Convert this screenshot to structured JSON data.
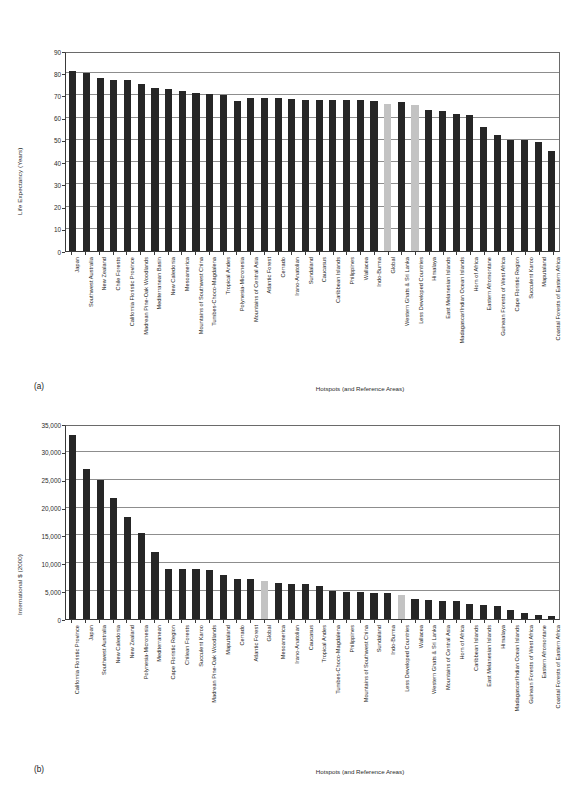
{
  "figure": {
    "panels": [
      {
        "tag": "(a)",
        "ylabel": "Life Expectancy (Years)",
        "xlabel": "Hotspots (and Reference Areas)"
      },
      {
        "tag": "(b)",
        "ylabel": "International $ (2000)",
        "xlabel": "Hotspots (and Reference Areas)"
      }
    ],
    "colors": {
      "bar": "#262626",
      "highlight": "#c3c3c3",
      "grid": "#8d8d8d",
      "axis": "#3a3a3a"
    }
  },
  "chart_data": [
    {
      "type": "bar",
      "title": "",
      "panel": "(a)",
      "xlabel": "Hotspots (and Reference Areas)",
      "ylabel": "Life Expectancy (Years)",
      "ylim": [
        0,
        90
      ],
      "yticks": [
        0,
        10,
        20,
        30,
        40,
        50,
        60,
        70,
        80,
        90
      ],
      "ytick_labels": [
        "0",
        "10",
        "20",
        "30",
        "40",
        "50",
        "60",
        "70",
        "80",
        "90"
      ],
      "grid": true,
      "legend": "none",
      "highlight_categories": [
        "Global",
        "Less Developed Countries"
      ],
      "categories": [
        "Japan",
        "Southwest Australia",
        "New Zealand",
        "Chile Forests",
        "California Floristic Province",
        "Madrean Pine-Oak Woodlands",
        "Mediterranean Basin",
        "New Caledonia",
        "Mesoamerica",
        "Mountains of Southwest China",
        "Tumbes-Choco-Magdalena",
        "Tropical Andes",
        "Polynesia-Micronesia",
        "Mountains of Central Asia",
        "Atlantic Forest",
        "Cerrado",
        "Irano-Anatolian",
        "Sundaland",
        "Caucasus",
        "Caribbean Islands",
        "Philippines",
        "Wallacea",
        "Indo-Burma",
        "Global",
        "Western Ghats & Sri Lanka",
        "Less Developed Countries",
        "Himalaya",
        "East Melanesian Islands",
        "Madagascar/Indian Ocean Islands",
        "Horn of Africa",
        "Eastern Afromontane",
        "Guinean Forests of West Africa",
        "Cape Floristic Region",
        "Succulent Karoo",
        "Maputaland",
        "Coastal Forests of Eastern Africa"
      ],
      "values": [
        81.0,
        80.0,
        78.0,
        77.0,
        77.0,
        75.0,
        73.5,
        73.0,
        72.0,
        71.0,
        70.8,
        70.0,
        67.5,
        69.0,
        69.0,
        69.0,
        68.3,
        68.0,
        68.0,
        68.0,
        68.0,
        68.0,
        67.5,
        66.0,
        67.0,
        65.5,
        63.5,
        63.0,
        61.5,
        61.0,
        56.0,
        52.0,
        50.0,
        50.0,
        49.0,
        45.0
      ]
    },
    {
      "type": "bar",
      "title": "",
      "panel": "(b)",
      "xlabel": "Hotspots (and Reference Areas)",
      "ylabel": "International $ (2000)",
      "ylim": [
        0,
        35000
      ],
      "yticks": [
        0,
        5000,
        10000,
        15000,
        20000,
        25000,
        30000,
        35000
      ],
      "ytick_labels": [
        "0",
        "5,000",
        "10,000",
        "15,000",
        "20,000",
        "25,000",
        "30,000",
        "35,000"
      ],
      "grid": true,
      "legend": "none",
      "highlight_categories": [
        "Global",
        "Less Developed Countries"
      ],
      "categories": [
        "California Floristic Province",
        "Japan",
        "Southwest Australia",
        "New Caledonia",
        "New Zealand",
        "Polynesia-Micronesia",
        "Mediterranean",
        "Cape Floristic Region",
        "Chilean Forests",
        "Succulent Karoo",
        "Madrean Pine-Oak Woodlands",
        "Maputaland",
        "Cerrado",
        "Atlantic Forest",
        "Global",
        "Mesoamerica",
        "Irano-Anatolian",
        "Caucasus",
        "Tropical Andes",
        "Tumbes-Choco-Magdalena",
        "Philippines",
        "Mountains of Southwest China",
        "Sundaland",
        "Indo-Burma",
        "Less Developed Countries",
        "Wallacea",
        "Western Ghats & Sri Lanka",
        "Mountains of Central Asia",
        "Horn of Africa",
        "Caribbean Islands",
        "East Melanesian Islands",
        "Himalaya",
        "Madagascar/Indian Ocean Islands",
        "Guinean Forests of West Africa",
        "Eastern Afromontane",
        "Coastal Forests of Eastern Africa"
      ],
      "values": [
        33000,
        27000,
        25000,
        21700,
        18400,
        15400,
        12000,
        9000,
        9000,
        9000,
        8800,
        7900,
        7200,
        7200,
        6800,
        6500,
        6200,
        6200,
        6000,
        5000,
        4900,
        4800,
        4700,
        4600,
        4400,
        3600,
        3400,
        3300,
        3300,
        2700,
        2500,
        2400,
        1600,
        1100,
        700,
        500
      ]
    }
  ]
}
